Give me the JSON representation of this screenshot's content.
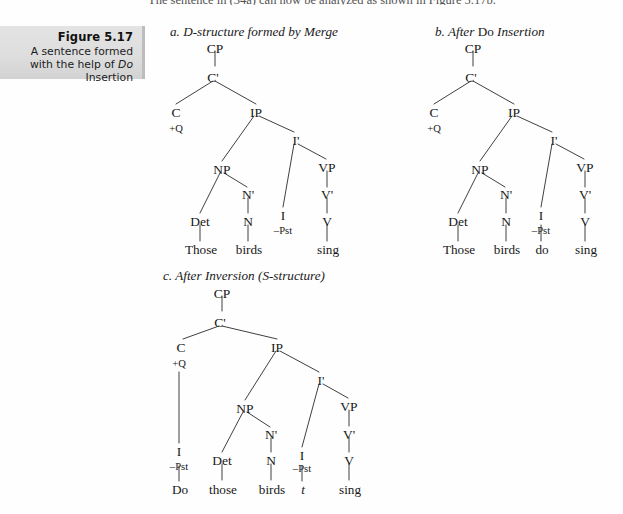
{
  "page": {
    "running_text": "The sentence in (34a) can now be analyzed as shown in Figure 5.17b.",
    "background_color": "#fefefe",
    "ink_color": "#1a1a1a"
  },
  "caption": {
    "figure_label": "Figure 5.17",
    "description_before": "A sentence formed with the help of ",
    "description_italic": "Do",
    "description_after": " Insertion",
    "box_color": "#dedede",
    "border_color": "#bdbdbd"
  },
  "trees": {
    "a": {
      "title_letter": "a.",
      "title_text": "D-structure formed by Merge",
      "nodes": {
        "cp": "CP",
        "cbar": "C'",
        "c": "C",
        "q": "+Q",
        "ip": "IP",
        "np": "NP",
        "nbar": "N'",
        "det": "Det",
        "n": "N",
        "ibar": "I'",
        "i": "I",
        "pst": "–Pst",
        "vp": "VP",
        "vbar": "V'",
        "v": "V"
      },
      "lexical": {
        "det_word": "Those",
        "n_word": "birds",
        "i_word": "",
        "v_word": "sing"
      }
    },
    "b": {
      "title_letter": "b.",
      "title_before": "After ",
      "title_roman": "Do",
      "title_after": " Insertion",
      "nodes": {
        "cp": "CP",
        "cbar": "C'",
        "c": "C",
        "q": "+Q",
        "ip": "IP",
        "np": "NP",
        "nbar": "N'",
        "det": "Det",
        "n": "N",
        "ibar": "I'",
        "i": "I",
        "pst": "–Pst",
        "vp": "VP",
        "vbar": "V'",
        "v": "V"
      },
      "lexical": {
        "det_word": "Those",
        "n_word": "birds",
        "i_word": "do",
        "v_word": "sing"
      }
    },
    "c": {
      "title_letter": "c.",
      "title_text": "After Inversion (S-structure)",
      "nodes": {
        "cp": "CP",
        "cbar": "C'",
        "c": "C",
        "q": "+Q",
        "ip": "IP",
        "np": "NP",
        "nbar": "N'",
        "det": "Det",
        "n": "N",
        "ibar": "I'",
        "i_c": "I",
        "pst_c": "–Pst",
        "i_ip": "I",
        "pst_ip": "–Pst",
        "vp": "VP",
        "vbar": "V'",
        "v": "V"
      },
      "lexical": {
        "c_word": "Do",
        "det_word": "those",
        "n_word": "birds",
        "trace": "t",
        "v_word": "sing"
      }
    }
  }
}
